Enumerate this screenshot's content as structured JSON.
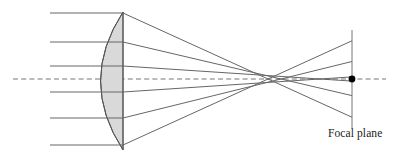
{
  "figure": {
    "title": "",
    "type": "optical-ray-diagram",
    "background_color": "#ffffff",
    "stroke_color": "#555555",
    "axis_color": "#777777",
    "glass_fill": "#d9d9d9",
    "glass_stroke": "#555555",
    "dot_color": "#000000",
    "label_color": "#1a1a1a"
  },
  "labels": {
    "focal_plane": "Focal plane"
  },
  "chart_data": {
    "type": "scatter",
    "xlabel": "",
    "ylabel": "",
    "xlim": [
      0,
      396
    ],
    "ylim": [
      0,
      158
    ],
    "grid": false,
    "legend": null,
    "optical_axis": {
      "y": 79,
      "x_start": 13,
      "x_end": 386,
      "style": "dashed"
    },
    "lens": {
      "shape": "plano-convex",
      "convex_side": "left",
      "flat_edge_x": 123,
      "vertex_x": 89,
      "top_y": 12,
      "bottom_y": 150,
      "sag": 34
    },
    "focal_plane": {
      "x": 352,
      "y_top": 30,
      "y_bottom": 128
    },
    "focus_dot": {
      "x": 352,
      "y": 79,
      "r": 3.4
    },
    "incoming_rays": {
      "x_start": 50,
      "heights": [
        13,
        42,
        66,
        92,
        118,
        145
      ]
    },
    "refracted_rays": [
      {
        "entry_y": 13,
        "exit_x": 123,
        "crossing_x": 268,
        "plane_y": 36
      },
      {
        "entry_y": 42,
        "exit_x": 123,
        "crossing_x": 281,
        "plane_y": 53
      },
      {
        "entry_y": 66,
        "exit_x": 123,
        "crossing_x": 320,
        "plane_y": 72
      },
      {
        "entry_y": 92,
        "exit_x": 123,
        "crossing_x": 320,
        "plane_y": 86
      },
      {
        "entry_y": 118,
        "exit_x": 123,
        "crossing_x": 281,
        "plane_y": 105
      },
      {
        "entry_y": 145,
        "exit_x": 123,
        "crossing_x": 268,
        "plane_y": 122
      }
    ],
    "caustic_note": "marginal rays cross the axis nearer the lens than paraxial rays"
  }
}
